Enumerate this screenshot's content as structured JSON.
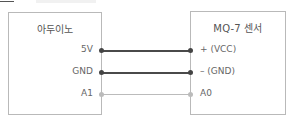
{
  "diagram": {
    "left_component": {
      "title": "아두이노",
      "pins": [
        "5V",
        "GND",
        "A1"
      ]
    },
    "right_component": {
      "title": "MQ-7 센서",
      "pins": [
        "+ (VCC)",
        "– (GND)",
        "A0"
      ]
    },
    "connections": [
      {
        "from": "5V",
        "to": "+ (VCC)",
        "color": "#4a4a4a"
      },
      {
        "from": "GND",
        "to": "– (GND)",
        "color": "#4a4a4a"
      },
      {
        "from": "A1",
        "to": "A0",
        "color": "#bbbbbb"
      }
    ]
  }
}
